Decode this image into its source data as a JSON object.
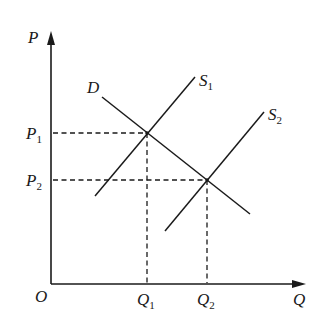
{
  "diagram": {
    "type": "supply-demand",
    "axes": {
      "y_label": "P",
      "x_label": "Q",
      "origin_label": "O"
    },
    "curves": [
      {
        "id": "D",
        "label": "D",
        "sub": "",
        "kind": "demand"
      },
      {
        "id": "S1",
        "label": "S",
        "sub": "1",
        "kind": "supply"
      },
      {
        "id": "S2",
        "label": "S",
        "sub": "2",
        "kind": "supply"
      }
    ],
    "price_levels": [
      {
        "label": "P",
        "sub": "1"
      },
      {
        "label": "P",
        "sub": "2"
      }
    ],
    "quantity_levels": [
      {
        "label": "Q",
        "sub": "1"
      },
      {
        "label": "Q",
        "sub": "2"
      }
    ],
    "equilibria": [
      {
        "curves": [
          "D",
          "S1"
        ],
        "price": "P1",
        "quantity": "Q1"
      },
      {
        "curves": [
          "D",
          "S2"
        ],
        "price": "P2",
        "quantity": "Q2"
      }
    ],
    "line_color": "#1a1a1a"
  }
}
